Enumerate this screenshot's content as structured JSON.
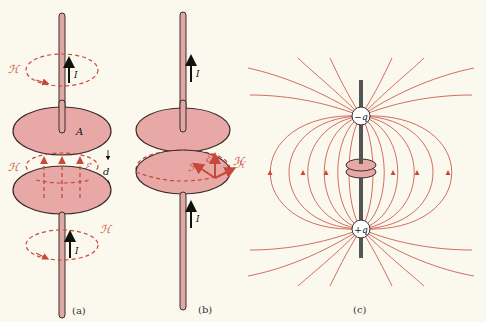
{
  "figure": {
    "panels": [
      {
        "id": "a",
        "caption": "(a)",
        "labels": {
          "h_top": "ℋ",
          "current_top": "I",
          "plate_area": "A",
          "h_mid": "ℋ",
          "e_mid": "ℰ",
          "gap": "d",
          "h_bottom": "ℋ",
          "current_bottom": "I"
        }
      },
      {
        "id": "b",
        "caption": "(b)",
        "labels": {
          "current_top": "I",
          "poynting": "ℱ",
          "e_field": "ℰ",
          "h_field": "ℋ",
          "current_bottom": "I"
        }
      },
      {
        "id": "c",
        "caption": "(c)",
        "labels": {
          "neg_charge": "−q",
          "pos_charge": "+q",
          "h_side": "ℋ"
        }
      }
    ],
    "colors": {
      "background": "#fbf9ee",
      "plate_fill": "#e8a9a6",
      "wire_fill": "#e0a8a4",
      "field_line": "#c8493c",
      "outline": "#3a2a2a"
    }
  }
}
